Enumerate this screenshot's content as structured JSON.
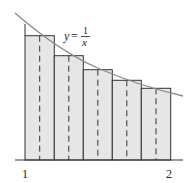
{
  "diagram": {
    "function_label": {
      "lhs": "y",
      "eq": "=",
      "num": "1",
      "den": "x"
    },
    "x_axis": {
      "ticks": [
        {
          "value": 1,
          "label": "1"
        },
        {
          "value": 2,
          "label": "2"
        }
      ]
    },
    "rectangles": {
      "count": 5,
      "fill": "#e6e6e6",
      "stroke": "#333333"
    },
    "curve_color": "#8a8a8a",
    "midpoint_lines": "dashed"
  }
}
